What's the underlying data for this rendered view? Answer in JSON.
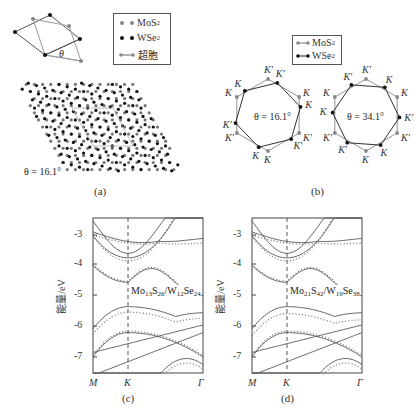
{
  "panel_a": {
    "legend": {
      "mos2": "MoS",
      "mos2_sub": "2",
      "wse2": "WSe",
      "wse2_sub": "2",
      "supercell": "超胞"
    },
    "theta_symbol": "θ",
    "angle_label": "θ = 16.1°",
    "caption": "(a)"
  },
  "panel_b": {
    "legend": {
      "mos2": "MoS",
      "mos2_sub": "2",
      "wse2": "WSe",
      "wse2_sub": "2"
    },
    "left_angle": "θ = 16.1°",
    "right_angle": "θ = 34.1°",
    "k_label": "K",
    "kprime_label": "K'",
    "caption": "(b)"
  },
  "panel_c": {
    "ylabel": "能量/eV",
    "yticks": [
      "-3",
      "-4",
      "-5",
      "-6",
      "-7"
    ],
    "xticks": [
      "M",
      "K",
      "Γ"
    ],
    "formula": {
      "a": "Mo",
      "a_sub": "13",
      "b": "S",
      "b_sub": "26",
      "c": "/W",
      "c_sub": "12",
      "d": "Se",
      "d_sub": "24"
    },
    "caption": "(c)"
  },
  "panel_d": {
    "ylabel": "能量/eV",
    "yticks": [
      "-3",
      "-4",
      "-5",
      "-6",
      "-7"
    ],
    "xticks": [
      "M",
      "K",
      "Γ"
    ],
    "formula": {
      "a": "Mo",
      "a_sub": "21",
      "b": "S",
      "b_sub": "42",
      "c": "/W",
      "c_sub": "19",
      "d": "Se",
      "d_sub": "38"
    },
    "caption": "(d)"
  },
  "colors": {
    "line": "#555555",
    "dotted": "#777777",
    "mos2_dot": "#888888",
    "wse2_dot": "#111111"
  }
}
